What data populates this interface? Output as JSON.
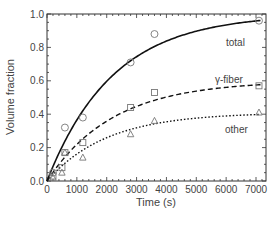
{
  "chart_data": {
    "type": "line",
    "title": "",
    "xlabel": "Time (s)",
    "ylabel": "Volume fraction",
    "xlim": [
      0,
      7200
    ],
    "ylim": [
      0,
      1.0
    ],
    "xticks": [
      0,
      1000,
      2000,
      3000,
      4000,
      5000,
      6000,
      7000
    ],
    "yticks": [
      0.0,
      0.2,
      0.4,
      0.6,
      0.8,
      1.0
    ],
    "grid": false,
    "legend": "inline labels",
    "series": [
      {
        "name": "total",
        "label": "total",
        "line_style": "solid",
        "marker": "circle",
        "fit": {
          "model": "1-exp(-t/tau)",
          "a": 1.0,
          "tau": 2200
        },
        "points": [
          [
            200,
            0.05
          ],
          [
            600,
            0.32
          ],
          [
            1200,
            0.38
          ],
          [
            2800,
            0.71
          ],
          [
            3600,
            0.88
          ],
          [
            7100,
            0.96
          ]
        ]
      },
      {
        "name": "gamma-fiber",
        "label": "γ-fiber",
        "line_style": "dashed",
        "marker": "square",
        "fit": {
          "model": "a(1-exp(-t/tau))",
          "a": 0.6,
          "tau": 2200
        },
        "points": [
          [
            200,
            0.03
          ],
          [
            500,
            0.08
          ],
          [
            600,
            0.17
          ],
          [
            1200,
            0.23
          ],
          [
            2800,
            0.44
          ],
          [
            3600,
            0.53
          ],
          [
            7100,
            0.57
          ]
        ]
      },
      {
        "name": "other",
        "label": "other",
        "line_style": "dotted",
        "marker": "triangle",
        "fit": {
          "model": "a(1-exp(-t/tau))",
          "a": 0.41,
          "tau": 2000
        },
        "points": [
          [
            200,
            0.02
          ],
          [
            500,
            0.05
          ],
          [
            600,
            0.17
          ],
          [
            1200,
            0.14
          ],
          [
            2800,
            0.28
          ],
          [
            3600,
            0.36
          ],
          [
            7100,
            0.41
          ]
        ]
      }
    ]
  }
}
